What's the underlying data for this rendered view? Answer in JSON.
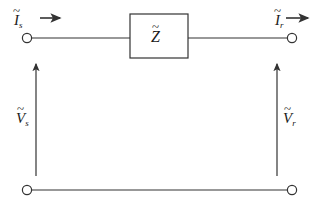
{
  "diagram": {
    "background_color": "#ffffff",
    "line_color": "#333333",
    "text_color": "#1a1a1a",
    "labels": {
      "sending_current": {
        "symbol": "I",
        "accent": "~",
        "subscript": "s",
        "text": "Ĩs"
      },
      "receiving_current": {
        "symbol": "I",
        "accent": "~",
        "subscript": "r",
        "text": "Ĩr"
      },
      "sending_voltage": {
        "symbol": "V",
        "accent": "~",
        "subscript": "s",
        "text": "Ṽs"
      },
      "receiving_voltage": {
        "symbol": "V",
        "accent": "~",
        "subscript": "r",
        "text": "Ṽr"
      },
      "impedance": {
        "symbol": "Z",
        "accent": "~",
        "subscript": "",
        "text": "Z̃"
      }
    },
    "components": [
      {
        "name": "impedance-box",
        "label": "Z̃",
        "x": 130,
        "y": 14,
        "width": 58,
        "height": 44
      }
    ],
    "terminals": [
      {
        "name": "terminal-top-left",
        "x": 27,
        "y": 38
      },
      {
        "name": "terminal-top-right",
        "x": 292,
        "y": 38
      },
      {
        "name": "terminal-bottom-left",
        "x": 27,
        "y": 190
      },
      {
        "name": "terminal-bottom-right",
        "x": 292,
        "y": 190
      }
    ],
    "current_arrows": [
      {
        "name": "current-arrow-sending",
        "direction": "right",
        "x1": 40,
        "y": 18,
        "x2": 62
      },
      {
        "name": "current-arrow-receiving",
        "direction": "right",
        "x1": 285,
        "y": 18,
        "x2": 310
      }
    ],
    "voltage_arrows": [
      {
        "name": "voltage-arrow-sending",
        "direction": "up",
        "x": 36,
        "y1": 176,
        "y2": 61
      },
      {
        "name": "voltage-arrow-receiving",
        "direction": "up",
        "x": 277,
        "y1": 176,
        "y2": 61
      }
    ],
    "wires": [
      {
        "name": "wire-top-left",
        "x1": 32,
        "y1": 38,
        "x2": 130,
        "y2": 38
      },
      {
        "name": "wire-top-right",
        "x1": 188,
        "y1": 38,
        "x2": 287,
        "y2": 38
      },
      {
        "name": "wire-bottom",
        "x1": 32,
        "y1": 190,
        "x2": 287,
        "y2": 190
      }
    ]
  }
}
